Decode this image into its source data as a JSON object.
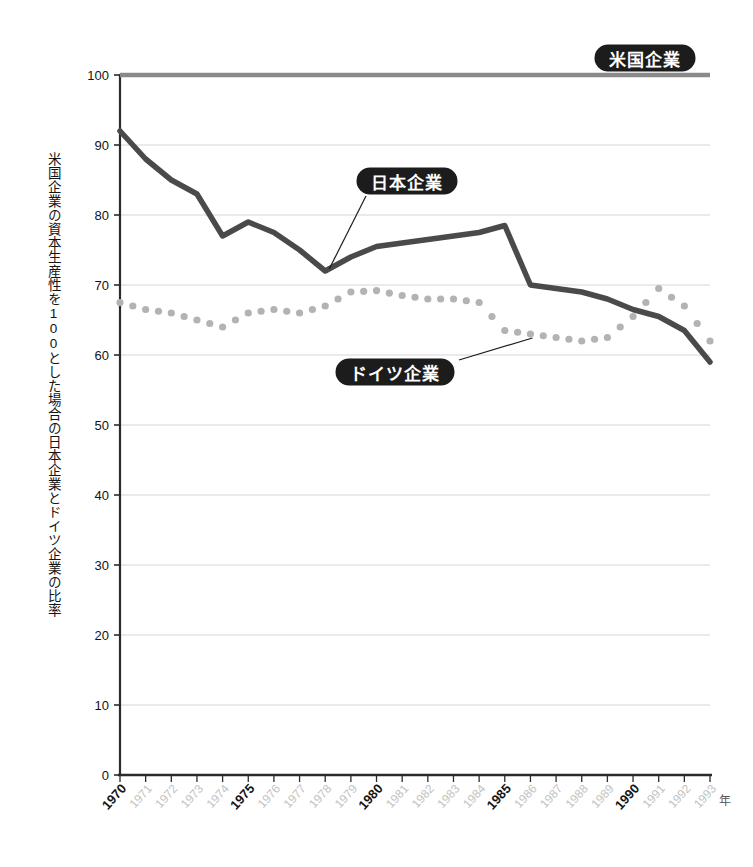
{
  "chart_data": {
    "type": "line",
    "title": "",
    "xlabel": "年",
    "ylabel": "米国企業の資本生産性を100とした場合の日本企業とドイツ企業の比率",
    "xlim": [
      1970,
      1993
    ],
    "ylim": [
      0,
      100
    ],
    "yticks": [
      0,
      10,
      20,
      30,
      40,
      50,
      60,
      70,
      80,
      90,
      100
    ],
    "xticks": [
      1970,
      1971,
      1972,
      1973,
      1974,
      1975,
      1976,
      1977,
      1978,
      1979,
      1980,
      1981,
      1982,
      1983,
      1984,
      1985,
      1986,
      1987,
      1988,
      1989,
      1990,
      1991,
      1992,
      1993
    ],
    "xticks_major": [
      1970,
      1975,
      1980,
      1985,
      1990
    ],
    "grid": true,
    "legend_position": "annotations",
    "reference_line": {
      "label": "米国企業",
      "value": 100,
      "color": "#8a8a8a"
    },
    "categories": [
      1970,
      1971,
      1972,
      1973,
      1974,
      1975,
      1976,
      1977,
      1978,
      1979,
      1980,
      1981,
      1982,
      1983,
      1984,
      1985,
      1986,
      1987,
      1988,
      1989,
      1990,
      1991,
      1992,
      1993
    ],
    "series": [
      {
        "name": "日本企業",
        "style": "solid",
        "color": "#4a4a4a",
        "values": [
          92.0,
          88.0,
          85.0,
          83.0,
          77.0,
          79.0,
          77.5,
          75.0,
          72.0,
          74.0,
          75.5,
          76.0,
          76.5,
          77.0,
          77.5,
          78.5,
          70.0,
          69.5,
          69.0,
          68.0,
          66.5,
          65.5,
          63.5,
          59.0
        ]
      },
      {
        "name": "ドイツ企業",
        "style": "dotted",
        "color": "#b3b3b3",
        "values": [
          67.5,
          66.5,
          66.0,
          65.0,
          64.0,
          66.0,
          66.5,
          66.0,
          67.0,
          69.0,
          69.2,
          68.5,
          68.0,
          68.0,
          67.5,
          63.5,
          63.0,
          62.5,
          62.0,
          62.5,
          65.5,
          69.5,
          67.0,
          62.0
        ]
      }
    ],
    "annotations": [
      {
        "name": "日本企業",
        "target_year": 1978,
        "target_value": 72.0
      },
      {
        "name": "ドイツ企業",
        "target_year": 1986,
        "target_value": 63.0
      },
      {
        "name": "米国企業",
        "target_year": 1993,
        "target_value": 100.0
      }
    ]
  },
  "badges": {
    "us": "米国企業",
    "japan": "日本企業",
    "germany": "ドイツ企業"
  },
  "axis": {
    "y_caption": "米国企業の資本生産性を100とした場合の日本企業とドイツ企業の比率",
    "x_unit": "年"
  }
}
